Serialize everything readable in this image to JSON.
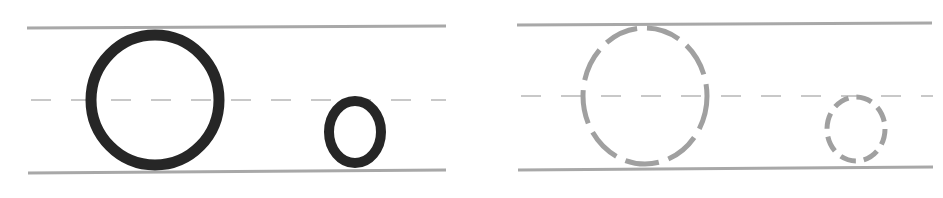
{
  "worksheet": {
    "letter_upper": "O",
    "letter_lower": "o",
    "colors": {
      "background": "#ffffff",
      "guide_line": "#a8a8a8",
      "mid_line": "#c8c8c8",
      "solid_letter": "#262626",
      "trace_letter": "#a0a0a0"
    },
    "panels": [
      {
        "name": "example",
        "style": "solid",
        "top_line": {
          "x1": 27,
          "x2": 446,
          "y1": 28,
          "y2": 26
        },
        "bottom_line": {
          "x1": 28,
          "x2": 446,
          "y1": 173,
          "y2": 170
        },
        "mid_line": {
          "x1": 31,
          "x2": 446,
          "y": 100
        },
        "upper": {
          "cx": 155,
          "cy": 100,
          "rx": 64,
          "ry": 65,
          "stroke": 11
        },
        "lower": {
          "cx": 355,
          "cy": 132,
          "rx": 26,
          "ry": 31,
          "stroke": 10
        }
      },
      {
        "name": "trace",
        "style": "dashed",
        "top_line": {
          "x1": 517,
          "x2": 932,
          "y1": 25,
          "y2": 23
        },
        "bottom_line": {
          "x1": 518,
          "x2": 933,
          "y1": 170,
          "y2": 167
        },
        "mid_line": {
          "x1": 521,
          "x2": 933,
          "y": 96
        },
        "upper": {
          "cx": 645,
          "cy": 96,
          "rx": 62,
          "ry": 68,
          "stroke": 5
        },
        "lower": {
          "cx": 856,
          "cy": 129,
          "rx": 29,
          "ry": 32,
          "stroke": 5
        }
      }
    ]
  }
}
